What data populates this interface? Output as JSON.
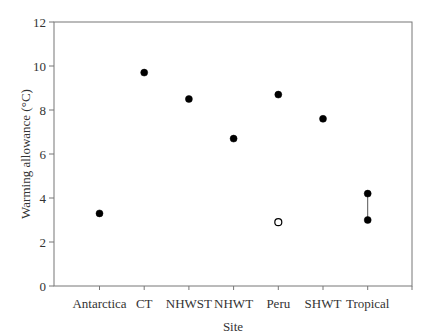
{
  "chart_data": {
    "type": "scatter",
    "title": "",
    "xlabel": "Site",
    "ylabel": "Warming allowance (°C)",
    "ylim": [
      0,
      12
    ],
    "yticks": [
      0,
      2,
      4,
      6,
      8,
      10,
      12
    ],
    "grid": false,
    "legend": null,
    "categories": [
      "Antarctica",
      "CT",
      "NHWST",
      "NHWT",
      "Peru",
      "SHWT",
      "Tropical"
    ],
    "series": [
      {
        "name": "filled",
        "marker": "filled-circle",
        "values": [
          3.3,
          9.7,
          8.5,
          6.7,
          8.7,
          7.6,
          4.2
        ]
      },
      {
        "name": "filled-lower",
        "marker": "filled-circle",
        "values": [
          null,
          null,
          null,
          null,
          null,
          null,
          3.0
        ]
      },
      {
        "name": "open",
        "marker": "open-circle",
        "values": [
          null,
          null,
          null,
          null,
          2.9,
          null,
          null
        ]
      }
    ],
    "annotations": [
      {
        "type": "vertical-line",
        "category": "Tropical",
        "from": 3.0,
        "to": 4.2
      }
    ]
  }
}
